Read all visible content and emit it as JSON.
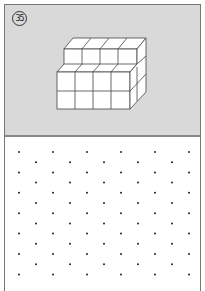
{
  "problem": {
    "number_label": "35",
    "figure": "isometric cube stack: back row 4 cubes at top level, front 4x2 block",
    "colors": {
      "panel_bg": "#d9d9d9",
      "line": "#444444",
      "dot": "#222222",
      "cube_face": "#ffffff"
    }
  },
  "dot_grid": {
    "rows": 13,
    "odd_row_cols": 6,
    "even_row_cols": 5,
    "x0": 19,
    "dx": 34,
    "y0": 152,
    "dy": 10.2
  }
}
